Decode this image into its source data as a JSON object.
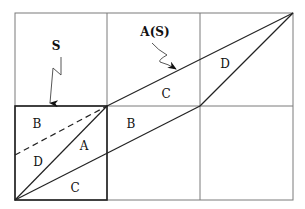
{
  "diagram": {
    "labels": {
      "set": "S",
      "image": "A(S)",
      "region_a": "A",
      "region_b": "B",
      "region_c": "C",
      "region_d": "D"
    }
  }
}
